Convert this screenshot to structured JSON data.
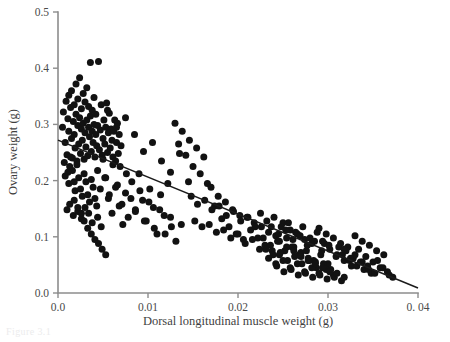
{
  "figure": {
    "caption_stub": "Figure 3.1",
    "background_color": "#ffffff",
    "point_color": "#121212",
    "line_color": "#1b1b1b",
    "axis_color": "#8d8d8d"
  },
  "chart_data": {
    "type": "scatter",
    "title": "",
    "xlabel": "Dorsal longitudinal muscle weight (g)",
    "ylabel": "Ovary weight (g)",
    "xlim": [
      0.0,
      0.04
    ],
    "ylim": [
      0.0,
      0.5
    ],
    "grid": false,
    "legend": null,
    "xticks": [
      0.0,
      0.01,
      0.02,
      0.03,
      0.04
    ],
    "xticklabels": [
      "0.0",
      "0.01",
      "0.02",
      "0.03",
      "0. 04"
    ],
    "yticks": [
      0.0,
      0.1,
      0.2,
      0.3,
      0.4,
      0.5
    ],
    "yticklabels": [
      "0.0",
      "0.1",
      "0.2",
      "0.3",
      "0.4",
      "0.5"
    ],
    "trendline": {
      "type": "linear-regression",
      "x_start": 0.0,
      "y_start": 0.272,
      "x_end": 0.04,
      "y_end": 0.009
    },
    "series": [
      {
        "name": "individuals",
        "marker": "filled-circle",
        "marker_size": 4.6,
        "x": [
          0.0005,
          0.0006,
          0.0008,
          0.0009,
          0.001,
          0.0011,
          0.0012,
          0.0012,
          0.0013,
          0.0014,
          0.0015,
          0.0015,
          0.0016,
          0.0017,
          0.0018,
          0.0018,
          0.0019,
          0.002,
          0.002,
          0.0021,
          0.0022,
          0.0022,
          0.0023,
          0.0024,
          0.0024,
          0.0025,
          0.0026,
          0.0026,
          0.0027,
          0.0028,
          0.0028,
          0.0029,
          0.003,
          0.003,
          0.0031,
          0.0032,
          0.0032,
          0.0033,
          0.0034,
          0.0034,
          0.0035,
          0.0036,
          0.0036,
          0.0037,
          0.0038,
          0.0038,
          0.0039,
          0.004,
          0.004,
          0.0041,
          0.0042,
          0.0042,
          0.0043,
          0.0044,
          0.0045,
          0.0046,
          0.0047,
          0.0048,
          0.0049,
          0.005,
          0.0051,
          0.0052,
          0.0053,
          0.0054,
          0.0055,
          0.0056,
          0.0057,
          0.0058,
          0.0059,
          0.006,
          0.0061,
          0.0062,
          0.0063,
          0.0064,
          0.0065,
          0.0066,
          0.0067,
          0.0068,
          0.0069,
          0.007,
          0.0008,
          0.0012,
          0.0016,
          0.0019,
          0.0023,
          0.0027,
          0.0031,
          0.0035,
          0.0039,
          0.0043,
          0.0007,
          0.0011,
          0.0014,
          0.0018,
          0.0021,
          0.0025,
          0.0029,
          0.0033,
          0.0037,
          0.0041,
          0.001,
          0.0013,
          0.0017,
          0.0022,
          0.0026,
          0.003,
          0.0034,
          0.0038,
          0.0044,
          0.0048,
          0.0052,
          0.0056,
          0.006,
          0.0064,
          0.0068,
          0.0072,
          0.0075,
          0.0078,
          0.0082,
          0.0086,
          0.009,
          0.0094,
          0.0098,
          0.0102,
          0.0106,
          0.011,
          0.0114,
          0.0118,
          0.0122,
          0.0126,
          0.013,
          0.0134,
          0.0138,
          0.0142,
          0.0146,
          0.015,
          0.0154,
          0.0158,
          0.0162,
          0.0166,
          0.017,
          0.0174,
          0.0178,
          0.0182,
          0.0186,
          0.019,
          0.0194,
          0.0198,
          0.0202,
          0.0206,
          0.021,
          0.0214,
          0.0218,
          0.0222,
          0.0226,
          0.023,
          0.0234,
          0.0238,
          0.0242,
          0.0246,
          0.025,
          0.0254,
          0.0258,
          0.0262,
          0.0266,
          0.027,
          0.0274,
          0.0278,
          0.0282,
          0.0286,
          0.029,
          0.0294,
          0.0298,
          0.0302,
          0.0306,
          0.031,
          0.0314,
          0.0318,
          0.0322,
          0.0326,
          0.033,
          0.0334,
          0.0338,
          0.0342,
          0.0346,
          0.035,
          0.0354,
          0.0358,
          0.0362,
          0.0366,
          0.0225,
          0.0232,
          0.024,
          0.0248,
          0.0256,
          0.0264,
          0.0272,
          0.028,
          0.0288,
          0.0296,
          0.0228,
          0.0236,
          0.0244,
          0.0252,
          0.026,
          0.0268,
          0.0276,
          0.0284,
          0.0292,
          0.03,
          0.0231,
          0.0239,
          0.0247,
          0.0255,
          0.0263,
          0.0271,
          0.0279,
          0.0287,
          0.0295,
          0.0303,
          0.0234,
          0.0242,
          0.025,
          0.0258,
          0.0266,
          0.0274,
          0.0282,
          0.029,
          0.0298,
          0.0306,
          0.0237,
          0.0245,
          0.0253,
          0.0261,
          0.0269,
          0.0277,
          0.0285,
          0.0293,
          0.0301,
          0.0309,
          0.0312,
          0.0316,
          0.032,
          0.0324,
          0.0328,
          0.0332,
          0.0336,
          0.034,
          0.0344,
          0.0348,
          0.0148,
          0.0155,
          0.0163,
          0.0171,
          0.0179,
          0.0187,
          0.0195,
          0.0203,
          0.0211,
          0.0219,
          0.0152,
          0.016,
          0.0168,
          0.0176,
          0.0184,
          0.0192,
          0.02,
          0.0208,
          0.0216,
          0.0224,
          0.0095,
          0.0105,
          0.0115,
          0.0125,
          0.0135,
          0.0145,
          0.0085,
          0.0075,
          0.0065,
          0.0055,
          0.0044,
          0.0047,
          0.005,
          0.0053,
          0.0057,
          0.0061,
          0.0066,
          0.0071,
          0.0076,
          0.0081,
          0.0086,
          0.0091,
          0.0096,
          0.0101,
          0.0107,
          0.0113,
          0.0119,
          0.0125,
          0.0131,
          0.0137,
          0.0355,
          0.0361,
          0.0368,
          0.0372,
          0.033,
          0.0338,
          0.0345,
          0.0352,
          0.0318,
          0.0325,
          0.0029,
          0.0033,
          0.0037,
          0.0041,
          0.0045,
          0.0049,
          0.0053,
          0.0026,
          0.0022,
          0.0018,
          0.0243,
          0.0251,
          0.0259,
          0.0267,
          0.0275,
          0.0283,
          0.0291,
          0.0299,
          0.0307,
          0.0315,
          0.0246,
          0.0254,
          0.0262,
          0.027,
          0.0278,
          0.0286,
          0.0294,
          0.0302,
          0.031,
          0.0318
        ],
        "y": [
          0.295,
          0.322,
          0.268,
          0.341,
          0.246,
          0.31,
          0.288,
          0.352,
          0.225,
          0.33,
          0.275,
          0.36,
          0.24,
          0.305,
          0.282,
          0.335,
          0.258,
          0.318,
          0.372,
          0.235,
          0.298,
          0.345,
          0.265,
          0.312,
          0.383,
          0.248,
          0.292,
          0.328,
          0.272,
          0.302,
          0.355,
          0.238,
          0.285,
          0.34,
          0.26,
          0.308,
          0.365,
          0.244,
          0.295,
          0.332,
          0.278,
          0.315,
          0.41,
          0.252,
          0.288,
          0.325,
          0.268,
          0.3,
          0.348,
          0.242,
          0.282,
          0.318,
          0.262,
          0.298,
          0.412,
          0.255,
          0.29,
          0.335,
          0.245,
          0.275,
          0.308,
          0.265,
          0.295,
          0.338,
          0.25,
          0.285,
          0.32,
          0.258,
          0.292,
          0.272,
          0.242,
          0.288,
          0.308,
          0.235,
          0.268,
          0.302,
          0.248,
          0.282,
          0.225,
          0.262,
          0.208,
          0.195,
          0.218,
          0.182,
          0.205,
          0.172,
          0.198,
          0.162,
          0.188,
          0.155,
          0.232,
          0.215,
          0.242,
          0.198,
          0.228,
          0.185,
          0.212,
          0.175,
          0.202,
          0.168,
          0.148,
          0.158,
          0.138,
          0.145,
          0.132,
          0.152,
          0.142,
          0.125,
          0.135,
          0.118,
          0.205,
          0.168,
          0.142,
          0.188,
          0.155,
          0.122,
          0.178,
          0.135,
          0.198,
          0.148,
          0.212,
          0.165,
          0.128,
          0.185,
          0.152,
          0.105,
          0.175,
          0.138,
          0.195,
          0.118,
          0.302,
          0.265,
          0.288,
          0.245,
          0.272,
          0.225,
          0.258,
          0.212,
          0.242,
          0.195,
          0.188,
          0.155,
          0.172,
          0.132,
          0.162,
          0.118,
          0.148,
          0.105,
          0.138,
          0.095,
          0.135,
          0.112,
          0.125,
          0.098,
          0.118,
          0.085,
          0.108,
          0.075,
          0.102,
          0.068,
          0.125,
          0.098,
          0.112,
          0.082,
          0.105,
          0.072,
          0.095,
          0.062,
          0.088,
          0.055,
          0.115,
          0.092,
          0.105,
          0.078,
          0.098,
          0.068,
          0.088,
          0.058,
          0.082,
          0.048,
          0.102,
          0.078,
          0.092,
          0.065,
          0.085,
          0.055,
          0.075,
          0.045,
          0.068,
          0.038,
          0.142,
          0.128,
          0.135,
          0.118,
          0.125,
          0.108,
          0.118,
          0.098,
          0.108,
          0.088,
          0.098,
          0.085,
          0.092,
          0.075,
          0.082,
          0.068,
          0.075,
          0.058,
          0.068,
          0.052,
          0.078,
          0.068,
          0.072,
          0.058,
          0.065,
          0.052,
          0.058,
          0.045,
          0.052,
          0.042,
          0.062,
          0.052,
          0.058,
          0.045,
          0.052,
          0.038,
          0.045,
          0.035,
          0.042,
          0.032,
          0.118,
          0.105,
          0.112,
          0.095,
          0.102,
          0.085,
          0.092,
          0.075,
          0.085,
          0.065,
          0.082,
          0.068,
          0.075,
          0.058,
          0.062,
          0.048,
          0.055,
          0.042,
          0.048,
          0.035,
          0.172,
          0.158,
          0.165,
          0.148,
          0.155,
          0.138,
          0.145,
          0.128,
          0.135,
          0.118,
          0.128,
          0.118,
          0.122,
          0.108,
          0.112,
          0.098,
          0.105,
          0.088,
          0.095,
          0.078,
          0.252,
          0.268,
          0.235,
          0.215,
          0.248,
          0.198,
          0.282,
          0.312,
          0.295,
          0.325,
          0.218,
          0.185,
          0.238,
          0.205,
          0.175,
          0.228,
          0.192,
          0.158,
          0.212,
          0.168,
          0.145,
          0.182,
          0.128,
          0.162,
          0.115,
          0.148,
          0.105,
          0.135,
          0.092,
          0.122,
          0.058,
          0.045,
          0.032,
          0.028,
          0.068,
          0.055,
          0.042,
          0.035,
          0.078,
          0.062,
          0.128,
          0.115,
          0.105,
          0.095,
          0.088,
          0.078,
          0.068,
          0.142,
          0.152,
          0.165,
          0.048,
          0.038,
          0.042,
          0.032,
          0.035,
          0.028,
          0.032,
          0.025,
          0.028,
          0.022,
          0.092,
          0.082,
          0.075,
          0.065,
          0.058,
          0.052,
          0.045,
          0.038,
          0.035,
          0.028
        ]
      }
    ]
  }
}
